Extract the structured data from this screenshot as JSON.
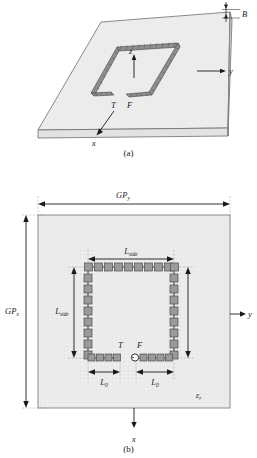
{
  "figure": {
    "title_a": "(a)",
    "title_b": "(b)",
    "type": "technical-diagram"
  },
  "panel_a": {
    "caption": "(a)",
    "labels": {
      "thickness": "B",
      "axis_y": "y",
      "axis_x": "x",
      "axis_z": "z",
      "terminal_t": "T",
      "feed_f": "F"
    }
  },
  "panel_b": {
    "caption": "(b)",
    "labels": {
      "ground_plane_y": "GP",
      "ground_plane_y_sub": "y",
      "ground_plane_x": "GP",
      "ground_plane_x_sub": "x",
      "side_top": "L",
      "side_top_sub": "side",
      "side_left": "L",
      "side_left_sub": "side",
      "l0_left": "L",
      "l0_left_sub": "0",
      "l0_right": "L",
      "l0_right_sub": "0",
      "terminal_t": "T",
      "feed_f": "F",
      "permittivity": "ε",
      "permittivity_sub": "r",
      "axis_y": "y",
      "axis_x": "x"
    }
  },
  "colors": {
    "substrate_fill": "#ececec",
    "substrate_edge": "#6d6d6d",
    "patch_fill": "#9a9a9a",
    "patch_edge": "#4a4a4a",
    "line": "#1a1a1a",
    "dash": "#8a8a8a"
  },
  "geometry": {
    "patches_top_count": 10,
    "patches_side_count": 8,
    "patches_bottom_left_count": 4,
    "patches_bottom_right_count": 4
  }
}
